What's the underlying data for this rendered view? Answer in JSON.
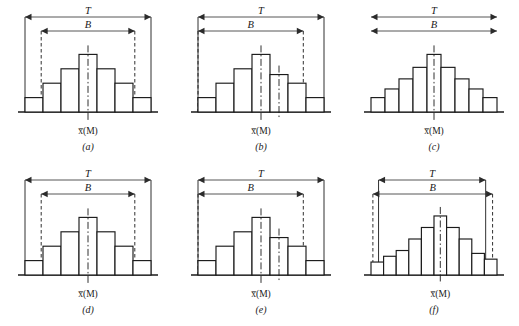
{
  "figure": {
    "title": "",
    "panel_count": 6,
    "columns": 3,
    "rows": 2,
    "labels": {
      "tolerance": "T",
      "spread": "B",
      "mean": "x̅(M)",
      "mean_base": "x",
      "mean_paren": "(M)"
    }
  },
  "chart_data": {
    "type": "bar",
    "title": "",
    "xlabel": "",
    "ylabel": "",
    "grid": false,
    "legend": null,
    "panels": [
      {
        "id": "a",
        "caption": "(a)",
        "mean_label": "x̅(M)",
        "tolerance_label": "T",
        "spread_label": "B",
        "categories": [
          "1",
          "2",
          "3",
          "4",
          "5",
          "6",
          "7"
        ],
        "values": [
          1,
          2,
          3,
          4,
          3,
          2,
          1
        ],
        "ylim": [
          0,
          5
        ],
        "tolerance_span": [
          0,
          7
        ],
        "spread_span": [
          0.9,
          6.1
        ],
        "spread_boundary_style": "dashed",
        "tolerance_boundary_style": "solid",
        "mean_bar_index": 3,
        "center_lines": [
          3.5
        ],
        "b_exceeds_t": false
      },
      {
        "id": "b",
        "caption": "(b)",
        "mean_label": "x̅(M)",
        "tolerance_label": "T",
        "spread_label": "B",
        "categories": [
          "1",
          "2",
          "3",
          "4",
          "5",
          "6",
          "7"
        ],
        "values": [
          1,
          2,
          3,
          4,
          2.6,
          2,
          1
        ],
        "ylim": [
          0,
          5
        ],
        "tolerance_span": [
          0,
          7
        ],
        "spread_span": [
          0,
          5.85
        ],
        "spread_boundary_style": "dashed",
        "tolerance_boundary_style": "solid",
        "mean_bar_index": 3,
        "center_lines": [
          3.5,
          4.5
        ],
        "b_exceeds_t": false
      },
      {
        "id": "c",
        "caption": "(c)",
        "mean_label": "x̅(M)",
        "tolerance_label": "T",
        "spread_label": "B",
        "categories": [
          "1",
          "2",
          "3",
          "4",
          "5",
          "6",
          "7",
          "8",
          "9"
        ],
        "values": [
          1,
          1.6,
          2.3,
          3.1,
          4,
          3.1,
          2.3,
          1.6,
          1
        ],
        "ylim": [
          0,
          5
        ],
        "tolerance_span": [
          0,
          9
        ],
        "spread_span": [
          0,
          9
        ],
        "spread_boundary_style": "none",
        "tolerance_boundary_style": "none",
        "mean_bar_index": 4,
        "center_lines": [
          4.5
        ],
        "b_exceeds_t": false
      },
      {
        "id": "d",
        "caption": "(d)",
        "mean_label": "x̅(M)",
        "tolerance_label": "T",
        "spread_label": "B",
        "categories": [
          "1",
          "2",
          "3",
          "4",
          "5",
          "6",
          "7"
        ],
        "values": [
          1,
          2,
          3,
          4,
          3,
          2,
          1
        ],
        "ylim": [
          0,
          5
        ],
        "tolerance_span": [
          0,
          7
        ],
        "spread_span": [
          0.9,
          6.1
        ],
        "spread_boundary_style": "dashed",
        "tolerance_boundary_style": "solid",
        "mean_bar_index": 3,
        "center_lines": [
          3.5
        ],
        "b_exceeds_t": false
      },
      {
        "id": "e",
        "caption": "(e)",
        "mean_label": "x̅(M)",
        "tolerance_label": "T",
        "spread_label": "B",
        "categories": [
          "1",
          "2",
          "3",
          "4",
          "5",
          "6",
          "7"
        ],
        "values": [
          1,
          2,
          3,
          4,
          2.6,
          2,
          1
        ],
        "ylim": [
          0,
          5
        ],
        "tolerance_span": [
          0,
          7
        ],
        "spread_span": [
          0,
          5.85
        ],
        "spread_boundary_style": "dashed",
        "tolerance_boundary_style": "solid",
        "mean_bar_index": 3,
        "center_lines": [
          3.5,
          4.5
        ],
        "b_exceeds_t": false
      },
      {
        "id": "f",
        "caption": "(f)",
        "mean_label": "x̅(M)",
        "tolerance_label": "T",
        "spread_label": "B",
        "categories": [
          "1",
          "2",
          "3",
          "4",
          "5",
          "6",
          "7",
          "8",
          "9",
          "10"
        ],
        "values": [
          0.9,
          1.3,
          1.7,
          2.5,
          3.3,
          4.1,
          3.3,
          2.5,
          1.5,
          1.1
        ],
        "ylim": [
          0,
          5
        ],
        "tolerance_span": [
          0.6,
          9.1
        ],
        "spread_span": [
          0.15,
          9.65
        ],
        "spread_boundary_style": "dashed",
        "tolerance_boundary_style": "solid",
        "mean_bar_index": 5,
        "center_lines": [
          5.5
        ],
        "b_exceeds_t": true
      }
    ]
  },
  "colors": {
    "ink": "#1a1a1a",
    "bar_stroke": "#1a1a1a",
    "bar_fill": "#ffffff",
    "dimension_line": "#2b2b2b",
    "background": "#ffffff"
  }
}
